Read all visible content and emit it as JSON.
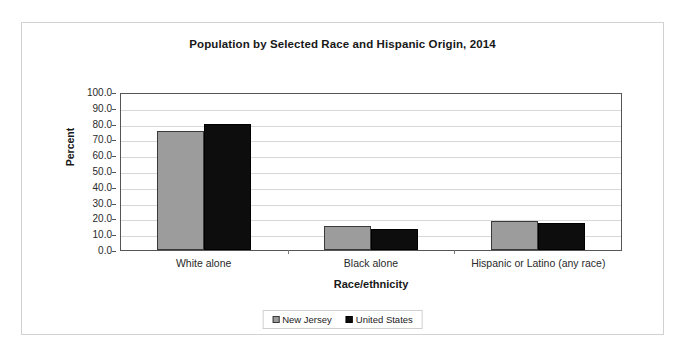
{
  "chart_data": {
    "type": "bar",
    "title": "Population by Selected Race and Hispanic Origin, 2014",
    "xlabel": "Race/ethnicity",
    "ylabel": "Percent",
    "categories": [
      "White alone",
      "Black alone",
      "Hispanic or Latino (any race)"
    ],
    "series": [
      {
        "name": "New Jersey",
        "color": "#9c9c9c",
        "values": [
          75.3,
          15.2,
          18.6
        ]
      },
      {
        "name": "United States",
        "color": "#0d0d0d",
        "values": [
          79.7,
          13.3,
          17.4
        ]
      }
    ],
    "ylim": [
      0.0,
      100.0
    ],
    "ytick_step": 10.0,
    "ytick_labels": [
      "100.0",
      "90.0",
      "80.0",
      "70.0",
      "60.0",
      "50.0",
      "40.0",
      "30.0",
      "20.0",
      "10.0",
      "0.0"
    ],
    "ytick_values": [
      100,
      90,
      80,
      70,
      60,
      50,
      40,
      30,
      20,
      10,
      0
    ],
    "grid": true,
    "legend_position": "bottom-center"
  },
  "figure": {
    "border_color": "#d2d2d2",
    "background": "#ffffff",
    "plot_border_color": "#555555",
    "gridline_color": "#d8d8d8"
  }
}
